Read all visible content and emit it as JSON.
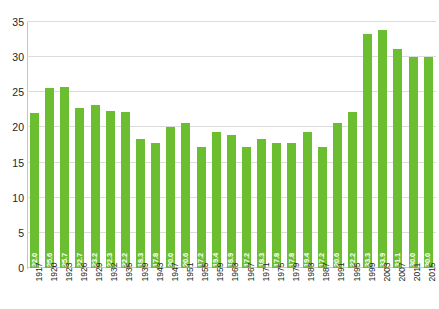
{
  "chart_data": {
    "type": "bar",
    "title": "",
    "xlabel": "",
    "ylabel": "",
    "ylim": [
      0,
      35
    ],
    "yticks": [
      0,
      5,
      10,
      15,
      20,
      25,
      30,
      35
    ],
    "grid": true,
    "legend": null,
    "bar_color": "#6cbe31",
    "value_label_color": "#ffffff",
    "axis_text_color": "#231f20",
    "gridline_color": "#dcdcdc",
    "categories": [
      "1917",
      "1920",
      "1923",
      "1926",
      "1929",
      "1932",
      "1935",
      "1939",
      "1943",
      "1947",
      "1951",
      "1955",
      "1959",
      "1963",
      "1967",
      "1971",
      "1975",
      "1979",
      "1983",
      "1987",
      "1991",
      "1995",
      "1999",
      "2003",
      "2007",
      "2011",
      "2015"
    ],
    "values": [
      22.0,
      25.6,
      25.7,
      22.7,
      23.2,
      22.3,
      22.2,
      18.3,
      17.8,
      20.0,
      20.6,
      17.2,
      19.4,
      18.9,
      17.2,
      18.3,
      17.8,
      17.8,
      19.4,
      17.2,
      20.6,
      22.2,
      33.3,
      33.9,
      31.1,
      30.0,
      30.0
    ],
    "value_labels": [
      "22.0",
      "25.6",
      "25.7",
      "22.7",
      "23.2",
      "22.3",
      "22.2",
      "18.3",
      "17.8",
      "20.0",
      "20.6",
      "17.2",
      "19.4",
      "18.9",
      "17.2",
      "18.3",
      "17.8",
      "17.8",
      "19.4",
      "17.2",
      "20.6",
      "22.2",
      "33.3",
      "33.9",
      "31.1",
      "30.0",
      "30.0"
    ]
  }
}
